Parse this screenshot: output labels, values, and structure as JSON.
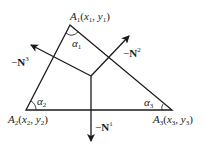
{
  "diagram": {
    "vertices": [
      {
        "name": "A1",
        "label_main": "A",
        "label_sub": "1",
        "coords": "(x1, y1)",
        "x": 70,
        "y": 25
      },
      {
        "name": "A2",
        "label_main": "A",
        "label_sub": "2",
        "coords": "(x2, y2)",
        "x": 26,
        "y": 110
      },
      {
        "name": "A3",
        "label_main": "A",
        "label_sub": "3",
        "coords": "(x3, y3)",
        "x": 172,
        "y": 110
      }
    ],
    "angles": [
      {
        "name": "alpha1",
        "symbol": "α",
        "sub": "1"
      },
      {
        "name": "alpha2",
        "symbol": "α",
        "sub": "2"
      },
      {
        "name": "alpha3",
        "symbol": "α",
        "sub": "3"
      }
    ],
    "vectors": [
      {
        "name": "-N1",
        "prefix": "−",
        "symbol": "N",
        "sup": "1"
      },
      {
        "name": "-N2",
        "prefix": "−",
        "symbol": "N",
        "sup": "2"
      },
      {
        "name": "-N3",
        "prefix": "−",
        "symbol": "N",
        "sup": "3"
      }
    ],
    "labels": {
      "a1_A": "A",
      "a1_sub": "1",
      "a1_rest_open": "(",
      "a1_x": "x",
      "a1_xsub": "1",
      "a1_comma": ", ",
      "a1_y": "y",
      "a1_ysub": "1",
      "a1_close": ")",
      "a2_A": "A",
      "a2_sub": "2",
      "a2_rest_open": "(",
      "a2_x": "x",
      "a2_xsub": "2",
      "a2_comma": ", ",
      "a2_y": "y",
      "a2_ysub": "2",
      "a2_close": ")",
      "a3_A": "A",
      "a3_sub": "3",
      "a3_rest_open": "(",
      "a3_x": "x",
      "a3_xsub": "3",
      "a3_comma": ", ",
      "a3_y": "y",
      "a3_ysub": "3",
      "a3_close": ")",
      "alpha": "α",
      "alpha1_sub": "1",
      "alpha2_sub": "2",
      "alpha3_sub": "3",
      "minus": "−",
      "N": "N",
      "n1_sup": "1",
      "n2_sup": "2",
      "n3_sup": "3"
    },
    "colors": {
      "stroke": "#1a1a1a",
      "background": "#ffffff"
    }
  }
}
